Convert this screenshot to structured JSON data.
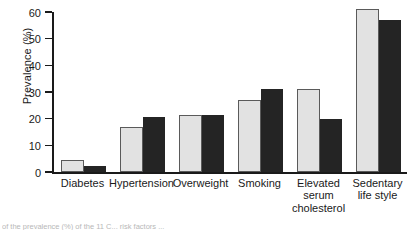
{
  "chart_data": {
    "type": "bar",
    "title": "",
    "xlabel": "",
    "ylabel": "Prevalence (%)",
    "ylim": [
      0,
      60
    ],
    "yticks": [
      0,
      10,
      20,
      30,
      40,
      50,
      60
    ],
    "ytick_labels": [
      "0",
      "10",
      "20",
      "30",
      "40",
      "50",
      "60"
    ],
    "grid": false,
    "legend": "none",
    "categories": [
      "Diabetes",
      "Hypertension",
      "Overweight",
      "Smoking",
      "Elevated serum cholesterol",
      "Sedentary life style"
    ],
    "category_lines": [
      [
        "Diabetes"
      ],
      [
        "Hypertension"
      ],
      [
        "Overweight"
      ],
      [
        "Smoking"
      ],
      [
        "Elevated",
        "serum",
        "cholesterol"
      ],
      [
        "Sedentary",
        "life style"
      ]
    ],
    "series": [
      {
        "name": "light",
        "color": "#e2e2e2",
        "values": [
          4.5,
          17,
          21.5,
          27,
          31,
          61
        ]
      },
      {
        "name": "dark",
        "color": "#242424",
        "values": [
          2.3,
          20.5,
          21.5,
          31,
          20,
          57
        ]
      }
    ]
  },
  "axis": {
    "y_label": "Prevalence (%)"
  },
  "caption": {
    "text": "of the prevalence (%) of the 11 C... risk factors ..."
  }
}
